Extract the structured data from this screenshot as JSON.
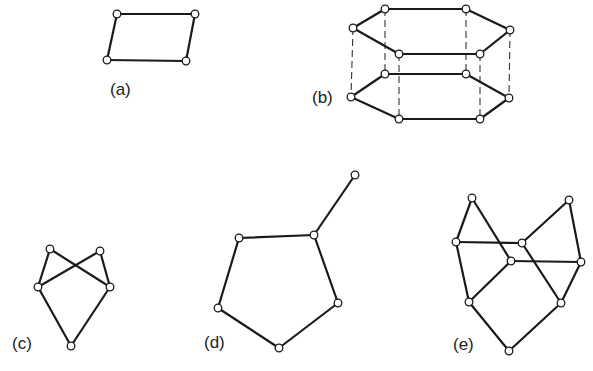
{
  "figure": {
    "node_radius": 3.8,
    "colors": {
      "edge": "#1a1a1a",
      "node_fill": "#ffffff",
      "background": "#ffffff"
    },
    "subfigures": [
      {
        "id": "a",
        "label": "(a)",
        "label_pos": [
          110,
          80
        ],
        "nodes": [
          [
            117,
            14
          ],
          [
            195,
            14
          ],
          [
            186,
            61
          ],
          [
            107,
            60
          ]
        ],
        "edges": [
          [
            0,
            1
          ],
          [
            1,
            2
          ],
          [
            2,
            3
          ],
          [
            3,
            0
          ]
        ],
        "dashed_edges": []
      },
      {
        "id": "b",
        "label": "(b)",
        "label_pos": [
          312,
          88
        ],
        "nodes": [
          [
            385,
            9
          ],
          [
            466,
            9
          ],
          [
            510,
            30
          ],
          [
            480,
            54
          ],
          [
            399,
            54
          ],
          [
            353,
            28
          ],
          [
            385,
            74
          ],
          [
            466,
            74
          ],
          [
            509,
            98
          ],
          [
            480,
            119
          ],
          [
            399,
            119
          ],
          [
            351,
            97
          ]
        ],
        "edges": [
          [
            0,
            1
          ],
          [
            1,
            2
          ],
          [
            2,
            3
          ],
          [
            3,
            4
          ],
          [
            4,
            5
          ],
          [
            5,
            0
          ],
          [
            6,
            7
          ],
          [
            7,
            8
          ],
          [
            8,
            9
          ],
          [
            9,
            10
          ],
          [
            10,
            11
          ],
          [
            11,
            6
          ]
        ],
        "dashed_edges": [
          [
            0,
            6
          ],
          [
            1,
            7
          ],
          [
            2,
            8
          ],
          [
            3,
            9
          ],
          [
            4,
            10
          ],
          [
            5,
            11
          ]
        ]
      },
      {
        "id": "c",
        "label": "(c)",
        "label_pos": [
          12,
          334
        ],
        "nodes": [
          [
            50,
            249
          ],
          [
            100,
            251
          ],
          [
            38,
            287
          ],
          [
            110,
            287
          ],
          [
            71,
            346
          ]
        ],
        "edges": [
          [
            0,
            2
          ],
          [
            0,
            3
          ],
          [
            1,
            2
          ],
          [
            1,
            3
          ],
          [
            2,
            4
          ],
          [
            3,
            4
          ]
        ],
        "dashed_edges": []
      },
      {
        "id": "d",
        "label": "(d)",
        "label_pos": [
          204,
          333
        ],
        "nodes": [
          [
            355,
            175
          ],
          [
            314,
            235
          ],
          [
            239,
            238
          ],
          [
            218,
            308
          ],
          [
            279,
            348
          ],
          [
            338,
            303
          ]
        ],
        "edges": [
          [
            0,
            1
          ],
          [
            1,
            2
          ],
          [
            2,
            3
          ],
          [
            3,
            4
          ],
          [
            4,
            5
          ],
          [
            5,
            1
          ]
        ],
        "dashed_edges": []
      },
      {
        "id": "e",
        "label": "(e)",
        "label_pos": [
          453,
          335
        ],
        "nodes": [
          [
            472,
            198
          ],
          [
            569,
            200
          ],
          [
            456,
            242
          ],
          [
            522,
            243
          ],
          [
            511,
            261
          ],
          [
            581,
            262
          ],
          [
            469,
            302
          ],
          [
            561,
            303
          ],
          [
            509,
            351
          ]
        ],
        "edges": [
          [
            0,
            2
          ],
          [
            0,
            4
          ],
          [
            2,
            3
          ],
          [
            2,
            6
          ],
          [
            1,
            3
          ],
          [
            1,
            5
          ],
          [
            3,
            7
          ],
          [
            4,
            5
          ],
          [
            4,
            6
          ],
          [
            5,
            7
          ],
          [
            6,
            8
          ],
          [
            7,
            8
          ]
        ],
        "dashed_edges": []
      }
    ]
  }
}
